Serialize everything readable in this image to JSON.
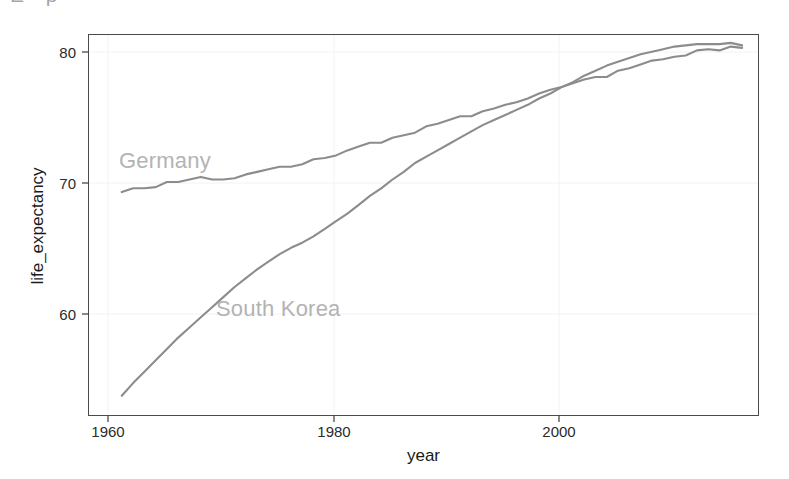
{
  "figure": {
    "cropped_header_text": "E  p",
    "background_color": "#ffffff",
    "panel_border_color": "#4a4a4a",
    "grid_color": "#f2f2f2",
    "line_color": "#8c8c8c",
    "series_label_color": "#b3b3b3",
    "axis_text_color": "#2b2b2b"
  },
  "axes": {
    "x": {
      "title": "year",
      "ticks": [
        {
          "label": "1960",
          "value": 1960
        },
        {
          "label": "1980",
          "value": 1980
        },
        {
          "label": "2000",
          "value": 2000
        }
      ],
      "range": [
        1957,
        2016.5
      ]
    },
    "y": {
      "title": "life_expectancy",
      "ticks": [
        {
          "label": "60",
          "value": 60
        },
        {
          "label": "70",
          "value": 70
        },
        {
          "label": "80",
          "value": 80
        }
      ],
      "range": [
        51.6,
        81.8
      ]
    }
  },
  "labels": {
    "germany": "Germany",
    "south_korea": "South Korea"
  },
  "chart_data": {
    "type": "line",
    "title": "",
    "xlabel": "year",
    "ylabel": "life_expectancy",
    "xlim": [
      1957,
      2016.5
    ],
    "ylim": [
      51.6,
      81.8
    ],
    "grid": true,
    "legend": "none (direct series labels in plot area)",
    "x": [
      1960,
      1961,
      1962,
      1963,
      1964,
      1965,
      1966,
      1967,
      1968,
      1969,
      1970,
      1971,
      1972,
      1973,
      1974,
      1975,
      1976,
      1977,
      1978,
      1979,
      1980,
      1981,
      1982,
      1983,
      1984,
      1985,
      1986,
      1987,
      1988,
      1989,
      1990,
      1991,
      1992,
      1993,
      1994,
      1995,
      1996,
      1997,
      1998,
      1999,
      2000,
      2001,
      2002,
      2003,
      2004,
      2005,
      2006,
      2007,
      2008,
      2009,
      2010,
      2011,
      2012,
      2013,
      2014,
      2015
    ],
    "series": [
      {
        "name": "Germany",
        "color": "#8c8c8c",
        "values": [
          69.3,
          69.6,
          69.6,
          69.7,
          70.1,
          70.1,
          70.3,
          70.5,
          70.3,
          70.3,
          70.4,
          70.7,
          70.9,
          71.1,
          71.3,
          71.3,
          71.5,
          71.9,
          72.0,
          72.2,
          72.6,
          72.9,
          73.2,
          73.2,
          73.6,
          73.8,
          74.0,
          74.5,
          74.7,
          75.0,
          75.3,
          75.3,
          75.7,
          75.9,
          76.2,
          76.4,
          76.7,
          77.1,
          77.4,
          77.6,
          77.9,
          78.2,
          78.4,
          78.4,
          78.9,
          79.1,
          79.4,
          79.7,
          79.8,
          80.0,
          80.1,
          80.5,
          80.6,
          80.5,
          80.8,
          80.7
        ]
      },
      {
        "name": "South Korea",
        "color": "#8c8c8c",
        "values": [
          53.2,
          54.2,
          55.1,
          56.0,
          56.9,
          57.8,
          58.6,
          59.4,
          60.2,
          61.0,
          61.8,
          62.5,
          63.2,
          63.8,
          64.4,
          64.9,
          65.3,
          65.8,
          66.4,
          67.0,
          67.6,
          68.3,
          69.0,
          69.6,
          70.3,
          70.9,
          71.6,
          72.1,
          72.6,
          73.1,
          73.6,
          74.1,
          74.6,
          75.0,
          75.4,
          75.8,
          76.2,
          76.7,
          77.1,
          77.6,
          78.0,
          78.5,
          78.9,
          79.3,
          79.6,
          79.9,
          80.2,
          80.4,
          80.6,
          80.8,
          80.9,
          81.0,
          81.0,
          81.0,
          81.1,
          80.9
        ]
      }
    ]
  }
}
